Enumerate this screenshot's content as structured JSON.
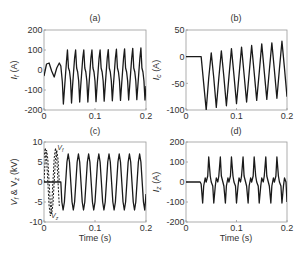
{
  "figure": {
    "width": 308,
    "height": 262,
    "line_color": "#1a1a1a",
    "axis_color": "#9a9a9a",
    "text_color": "#333333"
  },
  "chart_data": [
    {
      "id": "a",
      "type": "line",
      "title": "(a)",
      "xlabel": "",
      "ylabel": "I_f (A)",
      "ylabel_main": "I",
      "ylabel_sub": "f",
      "ylabel_unit": " (A)",
      "xlim": [
        0,
        0.2
      ],
      "ylim": [
        -200,
        200
      ],
      "xticks": [
        0,
        0.1,
        0.2
      ],
      "xtick_labels": [
        "0",
        "0.1",
        "0.2"
      ],
      "yticks": [
        200,
        100,
        0,
        -100,
        -200
      ],
      "ytick_labels": [
        "200",
        "100",
        "0",
        "-100",
        "-200"
      ],
      "grid": false,
      "box": {
        "left": 44,
        "top": 30,
        "right": 146,
        "bottom": 110
      },
      "series": [
        {
          "name": "I_f",
          "style": "solid",
          "description": "Low-amplitude (~35 A) oscillation before fault at ~0.033 s, then distorted periodic current with peaks ~+100 A and troughs ~-160 A, period ~0.02 s",
          "x": [
            0,
            0.005,
            0.01,
            0.015,
            0.02,
            0.025,
            0.03,
            0.033,
            0.036,
            0.038,
            0.04,
            0.042,
            0.044,
            0.046,
            0.048,
            0.05,
            0.052,
            0.054,
            0.056,
            0.058,
            0.06,
            0.062,
            0.064,
            0.066,
            0.068,
            0.07,
            0.072,
            0.074,
            0.076,
            0.078,
            0.08,
            0.082,
            0.084,
            0.086,
            0.088,
            0.09,
            0.092,
            0.094,
            0.096,
            0.098,
            0.1,
            0.102,
            0.104,
            0.106,
            0.108,
            0.11,
            0.112,
            0.114,
            0.116,
            0.118,
            0.12,
            0.122,
            0.124,
            0.126,
            0.128,
            0.13,
            0.132,
            0.134,
            0.136,
            0.138,
            0.14,
            0.142,
            0.144,
            0.146,
            0.148,
            0.15,
            0.152,
            0.154,
            0.156,
            0.158,
            0.16,
            0.162,
            0.164,
            0.166,
            0.168,
            0.17,
            0.172,
            0.174,
            0.176,
            0.178,
            0.18,
            0.182,
            0.184,
            0.186,
            0.188,
            0.19,
            0.192,
            0.194,
            0.196,
            0.198,
            0.2
          ],
          "y": [
            -30,
            30,
            35,
            -5,
            -35,
            10,
            35,
            20,
            -60,
            -170,
            -100,
            -30,
            40,
            100,
            10,
            -5,
            -50,
            -165,
            -80,
            -10,
            60,
            100,
            10,
            -10,
            -55,
            -160,
            -80,
            -10,
            60,
            100,
            10,
            -10,
            -55,
            -160,
            -80,
            -10,
            60,
            100,
            10,
            -10,
            -55,
            -158,
            -80,
            -10,
            60,
            100,
            10,
            -10,
            -55,
            -156,
            -80,
            -10,
            60,
            102,
            10,
            -10,
            -55,
            -154,
            -80,
            -10,
            60,
            104,
            10,
            -10,
            -55,
            -152,
            -80,
            -10,
            60,
            106,
            10,
            -10,
            -55,
            -150,
            -80,
            -10,
            60,
            108,
            10,
            -10,
            -55,
            -148,
            -80,
            -10,
            60,
            110,
            10,
            -10,
            -55,
            -150,
            -80
          ]
        }
      ]
    },
    {
      "id": "b",
      "type": "line",
      "title": "(b)",
      "xlabel": "",
      "ylabel": "I_c (A)",
      "ylabel_main": "I",
      "ylabel_sub": "c",
      "ylabel_unit": " (A)",
      "xlim": [
        0,
        0.2
      ],
      "ylim": [
        -100,
        50
      ],
      "xticks": [
        0,
        0.1,
        0.2
      ],
      "xtick_labels": [
        "0",
        "0.1",
        "0.2"
      ],
      "yticks": [
        50,
        0,
        -50,
        -100
      ],
      "ytick_labels": [
        "50",
        "0",
        "-50",
        "-100"
      ],
      "grid": false,
      "box": {
        "left": 186,
        "top": 30,
        "right": 287,
        "bottom": 110
      },
      "series": [
        {
          "name": "I_c",
          "style": "solid",
          "description": "Zero until ~0.03 s, then sinusoid with DC offset decaying: troughs from -100 rising to ~-75, peaks from ~5 rising to ~30",
          "x": [
            0,
            0.005,
            0.01,
            0.015,
            0.02,
            0.025,
            0.03,
            0.035,
            0.04,
            0.045,
            0.05,
            0.055,
            0.06,
            0.065,
            0.07,
            0.075,
            0.08,
            0.085,
            0.09,
            0.095,
            0.1,
            0.105,
            0.11,
            0.115,
            0.12,
            0.125,
            0.13,
            0.135,
            0.14,
            0.145,
            0.15,
            0.155,
            0.16,
            0.165,
            0.17,
            0.175,
            0.18,
            0.185,
            0.19,
            0.195,
            0.2
          ],
          "y": [
            0,
            0,
            0,
            0,
            0,
            0,
            0,
            -50,
            -100,
            -40,
            7,
            -40,
            -95,
            -40,
            11,
            -38,
            -92,
            -38,
            15,
            -35,
            -88,
            -35,
            18,
            -33,
            -85,
            -32,
            21,
            -30,
            -82,
            -30,
            24,
            -28,
            -80,
            -26,
            26,
            -25,
            -78,
            -23,
            29,
            -22,
            -75
          ]
        }
      ]
    },
    {
      "id": "c",
      "type": "line",
      "title": "(c)",
      "xlabel": "Time (s)",
      "ylabel": "V_f & V_z (kV)",
      "ylabel_main": "V",
      "ylabel_sub": "f",
      "ylabel_mid": " & V",
      "ylabel_sub2": "z",
      "ylabel_unit": " (kV)",
      "xlim": [
        0,
        0.2
      ],
      "ylim": [
        -10,
        10
      ],
      "xticks": [
        0,
        0.1,
        0.2
      ],
      "xtick_labels": [
        "0",
        "0.1",
        "0.2"
      ],
      "yticks": [
        10,
        5,
        0,
        -5,
        -10
      ],
      "ytick_labels": [
        "10",
        "5",
        "0",
        "-5",
        "-10"
      ],
      "grid": false,
      "box": {
        "left": 44,
        "top": 142,
        "right": 146,
        "bottom": 222
      },
      "annotations": [
        {
          "text": "V_f",
          "main": "V",
          "sub": "f",
          "x": 0.024,
          "y": 8.5
        },
        {
          "text": "V_z",
          "main": "V",
          "sub": "z",
          "x": 0.012,
          "y": -8.5
        }
      ],
      "series": [
        {
          "name": "V_f",
          "style": "dashed",
          "description": "Dashed sinusoid ±8 kV before fault (up to ~0.03 s)",
          "x": [
            0,
            0.0025,
            0.005,
            0.0075,
            0.01,
            0.0125,
            0.015,
            0.0175,
            0.02,
            0.0225,
            0.025,
            0.0275,
            0.03
          ],
          "y": [
            0,
            5.7,
            8,
            5.7,
            0,
            -5.7,
            -8,
            -5.7,
            0,
            5.7,
            8,
            5.7,
            0
          ]
        },
        {
          "name": "V_z",
          "style": "dashed",
          "description": "Dashed sinusoid ±8.5 kV before fault, phase shifted",
          "x": [
            0,
            0.0025,
            0.005,
            0.0075,
            0.01,
            0.0125,
            0.015,
            0.0175,
            0.02,
            0.0225,
            0.025,
            0.0275,
            0.03
          ],
          "y": [
            6,
            8.5,
            6,
            0,
            -6,
            -8.5,
            -6,
            0,
            6,
            8.5,
            6,
            0,
            -6
          ]
        },
        {
          "name": "V_f (after fault)",
          "style": "solid",
          "description": "Zero until ~0.033 s, then sinusoid with amplitude ~±7 kV, period ~0.02 s",
          "x": [
            0,
            0.033,
            0.035,
            0.0375,
            0.04,
            0.0425,
            0.045,
            0.0475,
            0.05,
            0.0525,
            0.055,
            0.0575,
            0.06,
            0.0625,
            0.065,
            0.0675,
            0.07,
            0.0725,
            0.075,
            0.0775,
            0.08,
            0.0825,
            0.085,
            0.0875,
            0.09,
            0.0925,
            0.095,
            0.0975,
            0.1,
            0.1025,
            0.105,
            0.1075,
            0.11,
            0.1125,
            0.115,
            0.1175,
            0.12,
            0.1225,
            0.125,
            0.1275,
            0.13,
            0.1325,
            0.135,
            0.1375,
            0.14,
            0.1425,
            0.145,
            0.1475,
            0.15,
            0.1525,
            0.155,
            0.1575,
            0.16,
            0.1625,
            0.165,
            0.1675,
            0.17,
            0.1725,
            0.175,
            0.1775,
            0.18,
            0.1825,
            0.185,
            0.1875,
            0.19,
            0.1925,
            0.195,
            0.1975,
            0.2
          ],
          "y": [
            0,
            0,
            -5,
            -7,
            -5,
            0,
            5,
            7,
            5,
            0,
            -5,
            -7,
            -5,
            0,
            5,
            7,
            5,
            0,
            -5,
            -7,
            -5,
            0,
            5,
            7,
            5,
            0,
            -5,
            -7,
            -5,
            0,
            5,
            7,
            5,
            0,
            -5,
            -7,
            -5,
            0,
            5,
            7,
            5,
            0,
            -5,
            -7,
            -5,
            0,
            5,
            7,
            5,
            0,
            -5,
            -7,
            -5,
            0,
            5,
            7,
            5,
            0,
            -5,
            -7,
            -5,
            0,
            5,
            7,
            5,
            0,
            -5,
            -7,
            -3
          ]
        }
      ]
    },
    {
      "id": "d",
      "type": "line",
      "title": "(d)",
      "xlabel": "Time (s)",
      "ylabel": "I_z (A)",
      "ylabel_main": "I",
      "ylabel_sub": "z",
      "ylabel_unit": " (A)",
      "xlim": [
        0,
        0.2
      ],
      "ylim": [
        -200,
        200
      ],
      "xticks": [
        0,
        0.1,
        0.2
      ],
      "xtick_labels": [
        "0",
        "0.1",
        "0.2"
      ],
      "yticks": [
        200,
        100,
        0,
        -100,
        -200
      ],
      "ytick_labels": [
        "200",
        "100",
        "0",
        "-100",
        "-200"
      ],
      "grid": false,
      "box": {
        "left": 186,
        "top": 142,
        "right": 287,
        "bottom": 222
      },
      "series": [
        {
          "name": "I_z",
          "style": "solid",
          "description": "Zero until ~0.03 s, then sharp alternating pulses: peaks ~+125 A, troughs ~-105 A, period ~0.02 s",
          "x": [
            0,
            0.028,
            0.03,
            0.033,
            0.035,
            0.038,
            0.04,
            0.043,
            0.045,
            0.048,
            0.05,
            0.053,
            0.055,
            0.058,
            0.06,
            0.063,
            0.065,
            0.068,
            0.07,
            0.073,
            0.075,
            0.078,
            0.08,
            0.083,
            0.085,
            0.088,
            0.09,
            0.093,
            0.095,
            0.098,
            0.1,
            0.103,
            0.105,
            0.108,
            0.11,
            0.113,
            0.115,
            0.118,
            0.12,
            0.123,
            0.125,
            0.128,
            0.13,
            0.133,
            0.135,
            0.138,
            0.14,
            0.143,
            0.145,
            0.148,
            0.15,
            0.153,
            0.155,
            0.158,
            0.16,
            0.163,
            0.165,
            0.168,
            0.17,
            0.173,
            0.175,
            0.178,
            0.18,
            0.183,
            0.185,
            0.188,
            0.19,
            0.193,
            0.195,
            0.198,
            0.2
          ],
          "y": [
            0,
            0,
            -10,
            -105,
            -20,
            20,
            0,
            30,
            125,
            30,
            0,
            -20,
            -105,
            -20,
            20,
            0,
            30,
            125,
            30,
            0,
            -20,
            -105,
            -20,
            20,
            0,
            30,
            125,
            30,
            0,
            -20,
            -105,
            -20,
            20,
            0,
            30,
            125,
            30,
            0,
            -20,
            -105,
            -20,
            20,
            0,
            30,
            125,
            30,
            0,
            -20,
            -105,
            -20,
            20,
            0,
            30,
            125,
            30,
            0,
            -20,
            -105,
            -20,
            20,
            0,
            30,
            125,
            30,
            0,
            -20,
            -105,
            -20,
            20,
            0,
            -100
          ]
        }
      ]
    }
  ]
}
